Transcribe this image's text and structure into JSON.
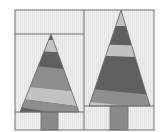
{
  "diagram": {
    "colors": {
      "background": "#ffffff",
      "fabric_light": "#ececec",
      "outline": "#6e6e6e",
      "dark": "#5f5f5f",
      "medium": "#8e8e8e",
      "light": "#c2c2c2",
      "trunk": "#8a8a8a"
    },
    "blocks": [
      {
        "name": "left-block",
        "tree": "short tree with top strip",
        "stripes_top_to_bottom": [
          "dark",
          "light",
          "dark",
          "medium",
          "light",
          "dark",
          "medium"
        ]
      },
      {
        "name": "right-block",
        "tree": "tall tree",
        "stripes_top_to_bottom": [
          "light",
          "dark",
          "light",
          "dark",
          "medium",
          "light"
        ]
      }
    ]
  }
}
